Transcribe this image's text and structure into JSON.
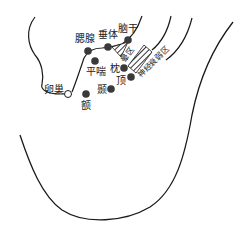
{
  "diagram": {
    "colors": {
      "line": "#1a1a1a",
      "point": "#3a3a3a",
      "hatch": "#333333",
      "background": "#ffffff"
    },
    "points": [
      {
        "id": "saixian",
        "label": "腮腺",
        "x": 88,
        "y": 51,
        "type": "filled"
      },
      {
        "id": "chuiti",
        "label": "垂体",
        "x": 108,
        "y": 47,
        "type": "filled"
      },
      {
        "id": "naogan",
        "label": "脑干",
        "x": 128,
        "y": 40,
        "type": "filled"
      },
      {
        "id": "pingchuan",
        "label": "平喘",
        "x": 95,
        "y": 61,
        "type": "filled"
      },
      {
        "id": "zhen",
        "label": "枕",
        "x": 124,
        "y": 68,
        "type": "filled"
      },
      {
        "id": "ding",
        "label": "顶",
        "x": 131,
        "y": 77,
        "type": "filled"
      },
      {
        "id": "nie",
        "label": "颞",
        "x": 111,
        "y": 89,
        "type": "filled"
      },
      {
        "id": "e",
        "label": "额",
        "x": 86,
        "y": 94,
        "type": "filled"
      },
      {
        "id": "luanchao",
        "label": "卵巢",
        "x": 68,
        "y": 94,
        "type": "open"
      }
    ],
    "zones": [
      {
        "id": "yunqu",
        "label": "晕区",
        "shape": "triangle-hatched"
      },
      {
        "id": "shenjingshuairuo",
        "label": "神经衰弱区",
        "shape": "rect-hatched"
      }
    ]
  }
}
